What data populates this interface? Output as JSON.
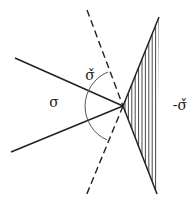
{
  "diagram": {
    "stroke_color": "#222222",
    "arc_color": "#555555",
    "vertex": {
      "x": 123,
      "y": 106
    },
    "cone_sigma": {
      "label": "σ",
      "label_pos": {
        "x": 54,
        "y": 107
      },
      "rays": [
        {
          "x1": 15,
          "y1": 58,
          "x2": 123,
          "y2": 106
        },
        {
          "x1": 11,
          "y1": 152,
          "x2": 123,
          "y2": 106
        }
      ]
    },
    "dual_cone": {
      "label": "σ̌",
      "label_pos": {
        "x": 90,
        "y": 80
      },
      "boundary_dashed": [
        {
          "x1": 87,
          "y1": 10,
          "x2": 123,
          "y2": 106
        },
        {
          "x1": 123,
          "y1": 106,
          "x2": 86,
          "y2": 196
        }
      ],
      "arc": {
        "start": {
          "x": 108,
          "y": 72
        },
        "end": {
          "x": 107,
          "y": 140
        },
        "radius": 37
      }
    },
    "negative_dual_cone": {
      "label": "-σ̌",
      "label_pos": {
        "x": 180,
        "y": 110
      },
      "hatched": true,
      "vertices": [
        {
          "x": 123,
          "y": 106
        },
        {
          "x": 159,
          "y": 17
        },
        {
          "x": 157,
          "y": 194
        }
      ],
      "hatch_spacing": 3.4
    }
  }
}
